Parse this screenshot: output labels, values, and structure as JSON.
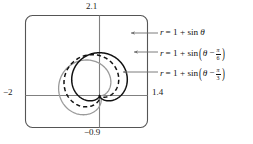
{
  "figure": {
    "type": "polar-graph-window",
    "window": {
      "top_label": "2.1",
      "bottom_label": "−0.9",
      "left_label": "−2",
      "right_label": "1.4",
      "xmin": -2,
      "xmax": 1.4,
      "ymin": -0.9,
      "ymax": 2.1,
      "frame_color": "#555555",
      "axis_color": "#777777",
      "background": "#ffffff"
    },
    "curves": [
      {
        "id": "curve-1",
        "label_parts": {
          "r": "r",
          "eq": "= 1 + sin",
          "theta": "θ"
        },
        "equation_text": "r = 1 + sin θ",
        "phase_deg": 0,
        "style": "solid",
        "color": "#111111",
        "width": 1.5
      },
      {
        "id": "curve-2",
        "label_parts": {
          "r": "r",
          "eq": "= 1 + sin",
          "theta": "θ",
          "minus": "−",
          "num": "π",
          "den": "6"
        },
        "equation_text": "r = 1 + sin(θ − π/6)",
        "phase_deg": -30,
        "style": "dashed",
        "color": "#111111",
        "width": 1.5
      },
      {
        "id": "curve-3",
        "label_parts": {
          "r": "r",
          "eq": "= 1 + sin",
          "theta": "θ",
          "minus": "−",
          "num": "π",
          "den": "3"
        },
        "equation_text": "r = 1 + sin(θ − π/3)",
        "phase_deg": -60,
        "style": "solid",
        "color": "#9a9a9a",
        "width": 1.3
      }
    ],
    "leader_lines": [
      {
        "id": "leader-1",
        "from_x": 158,
        "to_x": 131,
        "y": 33
      },
      {
        "id": "leader-2",
        "from_x": 158,
        "to_x": 134,
        "y": 52
      },
      {
        "id": "leader-3",
        "from_x": 158,
        "to_x": 123,
        "y": 72
      }
    ]
  }
}
